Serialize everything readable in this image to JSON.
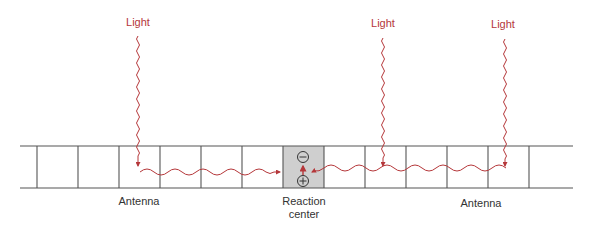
{
  "colors": {
    "light": "#b5373a",
    "line": "#555555",
    "reaction_center_fill": "#cfcfcf",
    "text": "#333333"
  },
  "light_sources": [
    {
      "label": "Light",
      "x": 138
    },
    {
      "label": "Light",
      "x": 383
    },
    {
      "label": "Light",
      "x": 505
    }
  ],
  "labels": {
    "antenna_left": "Antenna",
    "reaction_center_line1": "Reaction",
    "reaction_center_line2": "center",
    "antenna_right": "Antenna"
  },
  "reaction_center": {
    "top_symbol": "⊖",
    "bottom_symbol": "⊕"
  },
  "cells": {
    "left_boundaries": [
      37,
      78,
      119,
      160,
      201,
      242
    ],
    "reaction_center": [
      283,
      324
    ],
    "right_boundaries": [
      365,
      406,
      447,
      488,
      529
    ]
  }
}
